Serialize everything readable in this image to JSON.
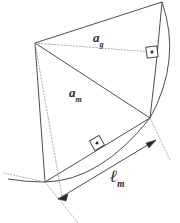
{
  "diagram": {
    "type": "geometry-sketch",
    "canvas": {
      "width": 180,
      "height": 223,
      "background": "#ffffff"
    },
    "colors": {
      "stroke_solid": "#3a3a3a",
      "stroke_dotted": "#8a8a8a",
      "arc": "#3a3a3a",
      "label_text": "#2b2b2b",
      "marker": "#3a3a3a"
    },
    "labels": [
      {
        "name": "apothem-g",
        "base": "a",
        "subscript": "g",
        "x": 93,
        "y": 31
      },
      {
        "name": "apothem-m",
        "base": "a",
        "subscript": "m",
        "x": 69,
        "y": 86
      },
      {
        "name": "arc-length-m",
        "base": "ℓ",
        "subscript": "m",
        "x": 110,
        "y": 168
      }
    ],
    "vertices": {
      "apex": {
        "x": 35,
        "y": 43
      },
      "top_right": {
        "x": 162,
        "y": 2
      },
      "right": {
        "x": 150,
        "y": 118
      },
      "bottom": {
        "x": 45,
        "y": 182
      },
      "left_lower": {
        "x": 34,
        "y": 180
      }
    },
    "right_angle_markers": [
      {
        "name": "right-angle-marker-upper",
        "x": 152,
        "y": 52,
        "rotation": -8
      },
      {
        "name": "right-angle-marker-lower",
        "x": 97,
        "y": 143,
        "rotation": -30
      }
    ],
    "dimension_arrow": {
      "name": "arc-length-dimension-arrow",
      "from": {
        "x": 58,
        "y": 199
      },
      "to": {
        "x": 156,
        "y": 140
      },
      "double_headed": true
    }
  }
}
